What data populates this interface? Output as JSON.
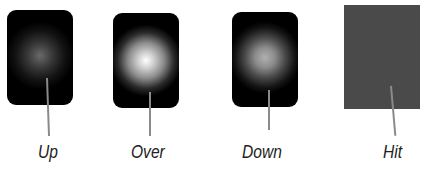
{
  "states": [
    {
      "label": "Up",
      "type": "button",
      "glow": "dim"
    },
    {
      "label": "Over",
      "type": "button",
      "glow": "bright"
    },
    {
      "label": "Down",
      "type": "button",
      "glow": "medium"
    },
    {
      "label": "Hit",
      "type": "hit-area",
      "glow": "none"
    }
  ],
  "colors": {
    "button_fill": "#000000",
    "hit_fill": "#4a4a4a",
    "leader": "#8a8a8a",
    "label": "#222222"
  }
}
